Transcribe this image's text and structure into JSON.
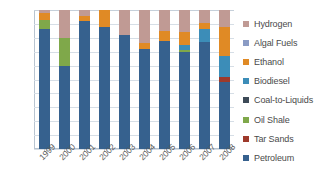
{
  "chart_data": {
    "type": "bar",
    "stacked": true,
    "stack_mode": "percent",
    "title": "",
    "subtitle": "",
    "xlabel": "",
    "ylabel": "",
    "ylim": [
      0,
      100
    ],
    "ytick_labels": [
      "100%",
      "90%",
      "80%",
      "70%",
      "60%",
      "50%",
      "40%",
      "30%",
      "20%",
      "10%",
      "0%"
    ],
    "ytick_values": [
      100,
      90,
      80,
      70,
      60,
      50,
      40,
      30,
      20,
      10,
      0
    ],
    "grid": true,
    "grid_axis": "y",
    "legend_position": "right",
    "categories": [
      "1999",
      "2000",
      "2001",
      "2002",
      "2003",
      "2004",
      "2005",
      "2006",
      "2007",
      "2008"
    ],
    "series": [
      {
        "name": "Petroleum",
        "color": "#36618E",
        "values": [
          86,
          60,
          92,
          88,
          82,
          72,
          78,
          70,
          77,
          48
        ]
      },
      {
        "name": "Tar Sands",
        "color": "#9E3A2B",
        "values": [
          0,
          0,
          0,
          0,
          0,
          0,
          0,
          0,
          0,
          4
        ]
      },
      {
        "name": "Oil Shale",
        "color": "#7FA84A",
        "values": [
          7,
          20,
          0,
          0,
          0,
          0,
          0,
          1,
          0,
          0
        ]
      },
      {
        "name": "Coal-to-Liquids",
        "color": "#3D4A57",
        "values": [
          0,
          0,
          0,
          0,
          0,
          0,
          0,
          0,
          0,
          0
        ]
      },
      {
        "name": "Biodiesel",
        "color": "#3C8DB8",
        "values": [
          0,
          0,
          0,
          0,
          0,
          0,
          0,
          4,
          9,
          15
        ]
      },
      {
        "name": "Ethanol",
        "color": "#E08A25",
        "values": [
          5,
          0,
          4,
          12,
          0,
          4,
          7,
          9,
          5,
          21
        ]
      },
      {
        "name": "Algal Fuels",
        "color": "#8A9BC4",
        "values": [
          0,
          0,
          0,
          0,
          0,
          0,
          0,
          0,
          0,
          0
        ]
      },
      {
        "name": "Hydrogen",
        "color": "#C09A94",
        "values": [
          2,
          20,
          4,
          0,
          18,
          24,
          15,
          16,
          9,
          12
        ]
      }
    ],
    "legend_order": [
      "Hydrogen",
      "Algal Fuels",
      "Ethanol",
      "Biodiesel",
      "Coal-to-Liquids",
      "Oil Shale",
      "Tar Sands",
      "Petroleum"
    ]
  }
}
